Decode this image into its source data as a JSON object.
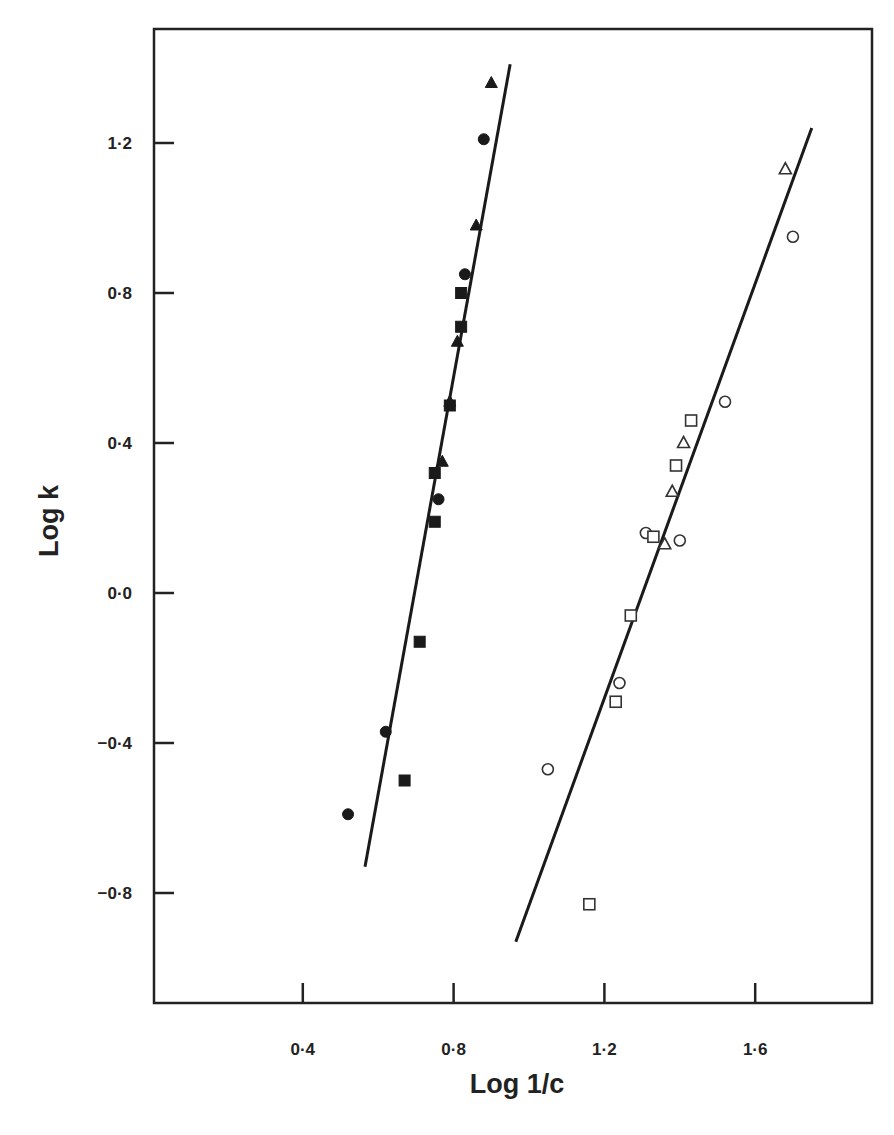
{
  "chart_data": {
    "type": "scatter",
    "title": "",
    "xlabel": "Log 1/c",
    "ylabel": "Log k",
    "xlim": [
      0.0,
      1.9
    ],
    "ylim": [
      -1.09,
      1.51
    ],
    "x_ticks": [
      0.4,
      0.8,
      1.2,
      1.6
    ],
    "x_tick_labels": [
      "0·4",
      "0·8",
      "1·2",
      "1·6"
    ],
    "y_ticks": [
      1.2,
      0.8,
      0.4,
      0.0,
      -0.4,
      -0.8
    ],
    "y_tick_labels": [
      "1·2",
      "0·8",
      "0·4",
      "0·0",
      "−0·4",
      "−0·8"
    ],
    "grid": false,
    "legend": null,
    "series": [
      {
        "name": "filled-circles",
        "marker": "circle",
        "filled": true,
        "points": [
          [
            0.88,
            1.21
          ],
          [
            0.83,
            0.85
          ],
          [
            0.76,
            0.25
          ],
          [
            0.62,
            -0.37
          ],
          [
            0.52,
            -0.59
          ]
        ]
      },
      {
        "name": "filled-squares",
        "marker": "square",
        "filled": true,
        "points": [
          [
            0.82,
            0.8
          ],
          [
            0.82,
            0.71
          ],
          [
            0.79,
            0.5
          ],
          [
            0.75,
            0.32
          ],
          [
            0.75,
            0.19
          ],
          [
            0.71,
            -0.13
          ],
          [
            0.67,
            -0.5
          ]
        ]
      },
      {
        "name": "filled-triangles",
        "marker": "triangle",
        "filled": true,
        "points": [
          [
            0.9,
            1.36
          ],
          [
            0.86,
            0.98
          ],
          [
            0.81,
            0.67
          ],
          [
            0.79,
            0.51
          ],
          [
            0.77,
            0.35
          ]
        ]
      },
      {
        "name": "open-circles",
        "marker": "circle",
        "filled": false,
        "points": [
          [
            1.7,
            0.95
          ],
          [
            1.52,
            0.51
          ],
          [
            1.31,
            0.16
          ],
          [
            1.4,
            0.14
          ],
          [
            1.24,
            -0.24
          ],
          [
            1.05,
            -0.47
          ]
        ]
      },
      {
        "name": "open-squares",
        "marker": "square",
        "filled": false,
        "points": [
          [
            1.43,
            0.46
          ],
          [
            1.39,
            0.34
          ],
          [
            1.33,
            0.15
          ],
          [
            1.27,
            -0.06
          ],
          [
            1.23,
            -0.29
          ],
          [
            1.16,
            -0.83
          ]
        ]
      },
      {
        "name": "open-triangles",
        "marker": "triangle",
        "filled": false,
        "points": [
          [
            1.68,
            1.13
          ],
          [
            1.41,
            0.4
          ],
          [
            1.38,
            0.27
          ],
          [
            1.36,
            0.13
          ]
        ]
      }
    ],
    "lines": [
      {
        "name": "fit-filled",
        "from": [
          0.565,
          -0.73
        ],
        "to": [
          0.95,
          1.41
        ]
      },
      {
        "name": "fit-open",
        "from": [
          0.965,
          -0.93
        ],
        "to": [
          1.75,
          1.24
        ]
      }
    ]
  },
  "layout": {
    "frame": {
      "left": 154,
      "top": 29,
      "right": 872,
      "bottom": 1003
    },
    "x_map": {
      "origin_px": 152,
      "px_per_unit": 377
    },
    "y_map": {
      "origin_px": 593,
      "px_per_unit": 375
    }
  }
}
